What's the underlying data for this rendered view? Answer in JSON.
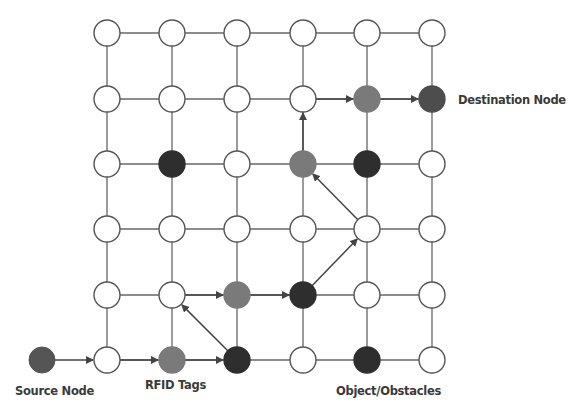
{
  "diagram": {
    "grid": {
      "rows": 6,
      "cols": 6,
      "col_x": [
        107,
        172,
        237,
        303,
        367,
        432
      ],
      "row_y": [
        33,
        99,
        164,
        229,
        295,
        360
      ],
      "node_radius": 13
    },
    "colors": {
      "empty": "#ffffff",
      "stroke": "#555555",
      "edge": "#666666",
      "rfid_tag": "#7a7a7a",
      "obstacle": "#2e2e2e",
      "destination": "#4d4d4d",
      "source": "#555555",
      "arrow": "#444444"
    },
    "special_nodes": [
      {
        "row": 1,
        "col": 4,
        "type": "rfid_tag"
      },
      {
        "row": 1,
        "col": 5,
        "type": "destination"
      },
      {
        "row": 2,
        "col": 1,
        "type": "obstacle"
      },
      {
        "row": 2,
        "col": 3,
        "type": "rfid_tag"
      },
      {
        "row": 2,
        "col": 4,
        "type": "obstacle"
      },
      {
        "row": 4,
        "col": 2,
        "type": "rfid_tag"
      },
      {
        "row": 4,
        "col": 3,
        "type": "obstacle"
      },
      {
        "row": 5,
        "col": 1,
        "type": "rfid_tag"
      },
      {
        "row": 5,
        "col": 2,
        "type": "obstacle"
      },
      {
        "row": 5,
        "col": 4,
        "type": "obstacle"
      }
    ],
    "source_node": {
      "x": 42,
      "y": 360
    },
    "path": [
      {
        "from": "source",
        "to": [
          5,
          0
        ]
      },
      {
        "from": [
          5,
          0
        ],
        "to": [
          5,
          1
        ]
      },
      {
        "from": [
          5,
          1
        ],
        "to": [
          5,
          2
        ]
      },
      {
        "from": [
          5,
          2
        ],
        "to": [
          4,
          1
        ]
      },
      {
        "from": [
          4,
          1
        ],
        "to": [
          4,
          2
        ]
      },
      {
        "from": [
          4,
          2
        ],
        "to": [
          4,
          3
        ]
      },
      {
        "from": [
          4,
          3
        ],
        "to": [
          3,
          4
        ]
      },
      {
        "from": [
          3,
          4
        ],
        "to": [
          2,
          3
        ]
      },
      {
        "from": [
          2,
          3
        ],
        "to": [
          1,
          3
        ]
      },
      {
        "from": [
          1,
          3
        ],
        "to": [
          1,
          4
        ]
      },
      {
        "from": [
          1,
          4
        ],
        "to": [
          1,
          5
        ]
      }
    ],
    "labels": {
      "destination": "Destination Node",
      "source": "Source Node",
      "rfid": "RFID Tags",
      "obstacle": "Object/Obstacles"
    }
  }
}
